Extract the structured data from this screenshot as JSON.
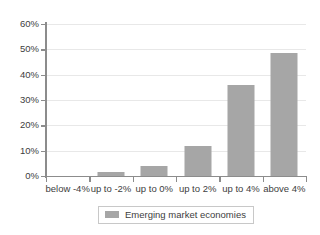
{
  "chart_data": {
    "type": "bar",
    "title": "",
    "subtitle": "",
    "xlabel": "",
    "ylabel": "",
    "categories": [
      "below -4%",
      "up to -2%",
      "up to 0%",
      "up to 2%",
      "up to 4%",
      "above 4%"
    ],
    "series": [
      {
        "name": "Emerging market economies",
        "color": "#a6a6a6",
        "values": [
          0,
          1.5,
          4,
          11.8,
          36,
          48.5
        ]
      }
    ],
    "values": [
      0,
      1.5,
      4,
      11.8,
      36,
      48.5
    ],
    "ylim": [
      0,
      60
    ],
    "ytick_values": [
      0,
      10,
      20,
      30,
      40,
      50,
      60
    ],
    "ytick_labels": [
      "0%",
      "10%",
      "20%",
      "30%",
      "40%",
      "50%",
      "60%"
    ],
    "grid": true,
    "grid_axis": "y",
    "legend_position": "bottom",
    "legend_entries": [
      "Emerging market economies"
    ]
  },
  "legend": {
    "label": "Emerging market economies",
    "swatch_color": "#a6a6a6"
  },
  "colors": {
    "bar": "#a6a6a6",
    "gridline": "#e8e8e8",
    "axis": "#8c8c8c",
    "text": "#404040",
    "background": "#ffffff"
  }
}
